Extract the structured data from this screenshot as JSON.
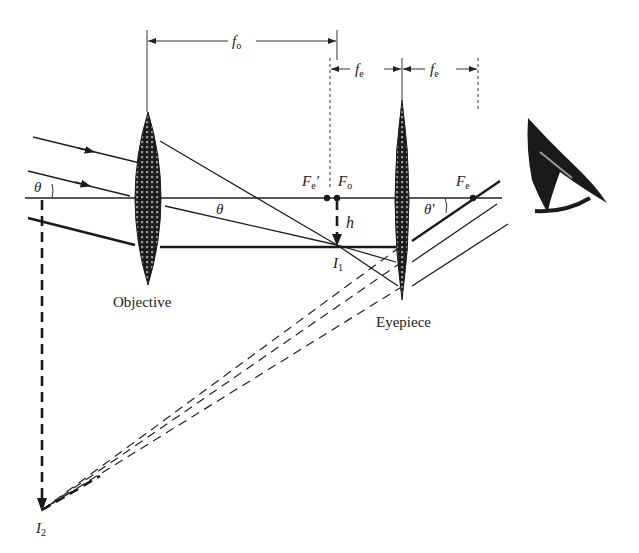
{
  "figure": {
    "labels": {
      "f_objective": "f",
      "f_objective_sub": "o",
      "f_eyepiece_1": "f",
      "f_eyepiece_1_sub": "e",
      "f_eyepiece_2": "f",
      "f_eyepiece_2_sub": "e",
      "theta_left": "θ",
      "theta_mid": "θ",
      "theta_prime": "θ′",
      "focal_point_eyepiece_prime": "F",
      "focal_point_eyepiece_prime_sub": "e",
      "focal_point_eyepiece_prime_mark": "′",
      "focal_point_objective": "F",
      "focal_point_objective_sub": "o",
      "focal_point_eyepiece": "F",
      "focal_point_eyepiece_sub": "e",
      "image_height": "h",
      "intermediate_image": "I",
      "intermediate_image_sub": "1",
      "final_image": "I",
      "final_image_sub": "2",
      "objective_lens": "Objective",
      "eyepiece_lens": "Eyepiece"
    },
    "colors": {
      "ink": "#1a1a1a",
      "background": "#ffffff"
    }
  }
}
